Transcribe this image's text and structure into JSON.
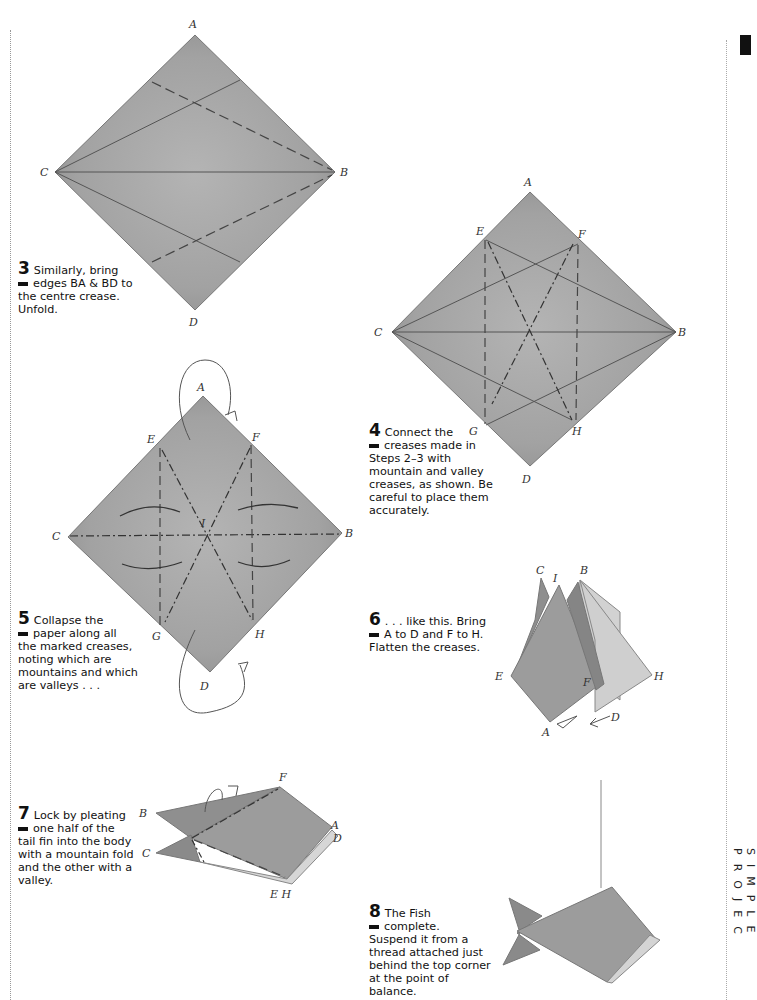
{
  "page": {
    "running_head": "SIMPLE PROJEC",
    "colors": {
      "paper": "#9a9a9a",
      "paper_light": "#c8c8c8",
      "ink": "#111111",
      "rule": "#999999"
    }
  },
  "steps": [
    {
      "number": "3",
      "text_line1": "Similarly, bring",
      "text_line2": "edges BA & BD to",
      "text_rest": "the centre crease. Unfold.",
      "labels": [
        "A",
        "B",
        "C",
        "D"
      ]
    },
    {
      "number": "4",
      "text_line1": "Connect the",
      "text_line2": "creases made in",
      "text_rest": "Steps 2–3 with mountain and valley creases, as shown. Be careful to place them accurately.",
      "labels": [
        "A",
        "B",
        "C",
        "D",
        "E",
        "F",
        "G",
        "H"
      ]
    },
    {
      "number": "5",
      "text_line1": "Collapse the",
      "text_line2": "paper along all",
      "text_rest": "the marked creases, noting which are mountains and which are valleys . . .",
      "labels": [
        "A",
        "B",
        "C",
        "D",
        "E",
        "F",
        "G",
        "H",
        "I"
      ]
    },
    {
      "number": "6",
      "text_line1": ". . . like this. Bring",
      "text_line2": "A to D and F to H.",
      "text_rest": "Flatten the creases.",
      "labels": [
        "A",
        "B",
        "C",
        "D",
        "E",
        "F",
        "H",
        "I"
      ]
    },
    {
      "number": "7",
      "text_line1": "Lock by pleating",
      "text_line2": "one half of the",
      "text_rest": "tail fin into the body with a mountain fold and the other with a valley.",
      "labels": [
        "A",
        "B",
        "C",
        "D",
        "E H",
        "F"
      ]
    },
    {
      "number": "8",
      "text_line1": "The Fish",
      "text_line2": "complete.",
      "text_rest": "Suspend it from a thread attached just behind the top corner at the point of balance.",
      "labels": []
    }
  ]
}
